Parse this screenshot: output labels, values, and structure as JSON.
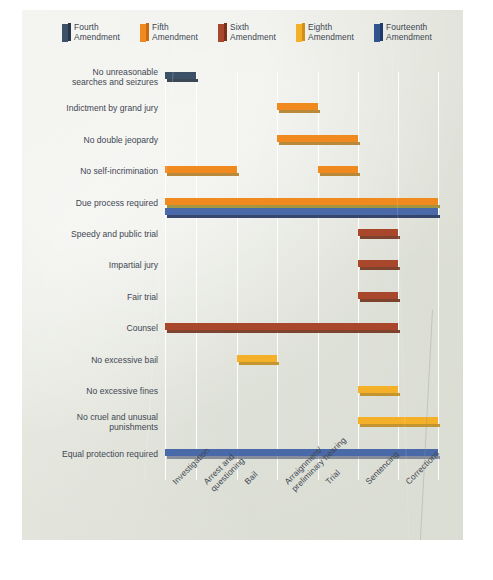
{
  "panel": {
    "background_color": "#e2e4db"
  },
  "legend": {
    "items": [
      {
        "label": "Fourth\nAmendment",
        "color": "#3c5168",
        "side_color": "#27364a",
        "icon": "book-swatch-icon"
      },
      {
        "label": "Fifth\nAmendment",
        "color": "#f08a1e",
        "side_color": "#c96a10",
        "icon": "book-swatch-icon"
      },
      {
        "label": "Sixth\nAmendment",
        "color": "#a8472b",
        "side_color": "#7e3119",
        "icon": "book-swatch-icon"
      },
      {
        "label": "Eighth\nAmendment",
        "color": "#f5b02a",
        "side_color": "#d1901a",
        "icon": "book-swatch-icon"
      },
      {
        "label": "Fourteenth\nAmendment",
        "color": "#33538f",
        "side_color": "#1f3a6b",
        "icon": "book-swatch-icon"
      }
    ]
  },
  "chart_data": {
    "type": "bar",
    "title": "",
    "xlabel": "",
    "ylabel": "",
    "orientation": "horizontal",
    "grid": true,
    "legend_position": "top",
    "categories": [
      "Investigation",
      "Arrest and\nquestioning",
      "Bail",
      "Arraignment/\npreliminary hearing",
      "Trial",
      "Sentencing",
      "Corrections"
    ],
    "rows": [
      {
        "label": "No unreasonable\nsearches and seizures",
        "bars": [
          {
            "amendment": "Fourth",
            "color": "#3c5168",
            "shadow": "#22303f",
            "start_col": 1,
            "end_col": 1
          }
        ]
      },
      {
        "label": "Indictment by grand jury",
        "bars": [
          {
            "amendment": "Fifth",
            "color": "#f08a1e",
            "shadow": "#b07b22",
            "start_col": 4,
            "end_col": 4
          }
        ]
      },
      {
        "label": "No double jeopardy",
        "bars": [
          {
            "amendment": "Fifth",
            "color": "#f08a1e",
            "shadow": "#b07b22",
            "start_col": 4,
            "end_col": 5
          }
        ]
      },
      {
        "label": "No self-incrimination",
        "bars": [
          {
            "amendment": "Fifth",
            "color": "#f08a1e",
            "shadow": "#b07b22",
            "start_col": 1,
            "end_col": 2
          },
          {
            "amendment": "Fifth",
            "color": "#f08a1e",
            "shadow": "#b07b22",
            "start_col": 5,
            "end_col": 5
          }
        ]
      },
      {
        "label": "Due process required",
        "bars": [
          {
            "amendment": "Fifth",
            "color": "#f08a1e",
            "shadow": "#9a8a28",
            "start_col": 1,
            "end_col": 7
          },
          {
            "amendment": "Fourteenth",
            "color": "#4a69a8",
            "shadow": "#1d2f5c",
            "start_col": 1,
            "end_col": 7,
            "stacked_below": true
          }
        ]
      },
      {
        "label": "Speedy and public trial",
        "bars": [
          {
            "amendment": "Sixth",
            "color": "#a8472b",
            "shadow": "#702c16",
            "start_col": 6,
            "end_col": 6
          }
        ]
      },
      {
        "label": "Impartial jury",
        "bars": [
          {
            "amendment": "Sixth",
            "color": "#a8472b",
            "shadow": "#702c16",
            "start_col": 6,
            "end_col": 6
          }
        ]
      },
      {
        "label": "Fair trial",
        "bars": [
          {
            "amendment": "Sixth",
            "color": "#a8472b",
            "shadow": "#702c16",
            "start_col": 6,
            "end_col": 6
          }
        ]
      },
      {
        "label": "Counsel",
        "bars": [
          {
            "amendment": "Sixth",
            "color": "#a8472b",
            "shadow": "#702c16",
            "start_col": 1,
            "end_col": 6
          }
        ]
      },
      {
        "label": "No excessive bail",
        "bars": [
          {
            "amendment": "Eighth",
            "color": "#f5b02a",
            "shadow": "#c08a18",
            "start_col": 3,
            "end_col": 3
          }
        ]
      },
      {
        "label": "No excessive fines",
        "bars": [
          {
            "amendment": "Eighth",
            "color": "#f5b02a",
            "shadow": "#c08a18",
            "start_col": 6,
            "end_col": 6
          }
        ]
      },
      {
        "label": "No cruel and unusual\npunishments",
        "bars": [
          {
            "amendment": "Eighth",
            "color": "#f5b02a",
            "shadow": "#c08a18",
            "start_col": 6,
            "end_col": 7
          }
        ]
      },
      {
        "label": "Equal protection required",
        "bars": [
          {
            "amendment": "Fourteenth",
            "color": "#4a69a8",
            "shadow": "#17255180",
            "start_col": 1,
            "end_col": 7
          }
        ]
      }
    ]
  }
}
